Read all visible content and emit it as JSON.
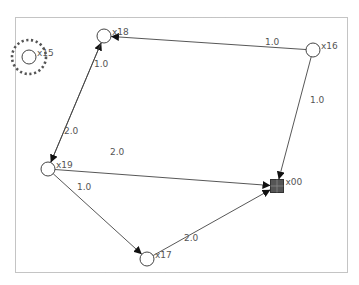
{
  "graph": {
    "frame": {
      "x": 15,
      "y": 17,
      "width": 332,
      "height": 255
    },
    "nodes": [
      {
        "id": "x15",
        "label": "x15",
        "x": 29,
        "y": 57,
        "shape": "circle",
        "selected": true
      },
      {
        "id": "x18",
        "label": "x18",
        "x": 104,
        "y": 36,
        "shape": "circle",
        "selected": false
      },
      {
        "id": "x16",
        "label": "x16",
        "x": 313,
        "y": 50,
        "shape": "circle",
        "selected": false
      },
      {
        "id": "x19",
        "label": "x19",
        "x": 48,
        "y": 169,
        "shape": "circle",
        "selected": false
      },
      {
        "id": "x00",
        "label": "x00",
        "x": 277,
        "y": 186,
        "shape": "square",
        "selected": false
      },
      {
        "id": "x17",
        "label": "x17",
        "x": 147,
        "y": 259,
        "shape": "circle",
        "selected": false
      }
    ],
    "edges": [
      {
        "from": "x16",
        "to": "x18",
        "weight": "1.0",
        "label_x": 265,
        "label_y": 45
      },
      {
        "from": "x19",
        "to": "x18",
        "weight": "1.0",
        "label_x": 94,
        "label_y": 67
      },
      {
        "from": "x18",
        "to": "x19",
        "weight": "2.0",
        "label_x": 64,
        "label_y": 134
      },
      {
        "from": "x16",
        "to": "x00",
        "weight": "1.0",
        "label_x": 310,
        "label_y": 103
      },
      {
        "from": "x19",
        "to": "x00",
        "weight": "2.0",
        "label_x": 110,
        "label_y": 155
      },
      {
        "from": "x19",
        "to": "x17",
        "weight": "1.0",
        "label_x": 77,
        "label_y": 190
      },
      {
        "from": "x17",
        "to": "x00",
        "weight": "2.0",
        "label_x": 184,
        "label_y": 241
      }
    ]
  },
  "colors": {
    "edge": "#444444",
    "node_stroke": "#444444",
    "sink_fill": "#555555",
    "label": "#555555"
  }
}
